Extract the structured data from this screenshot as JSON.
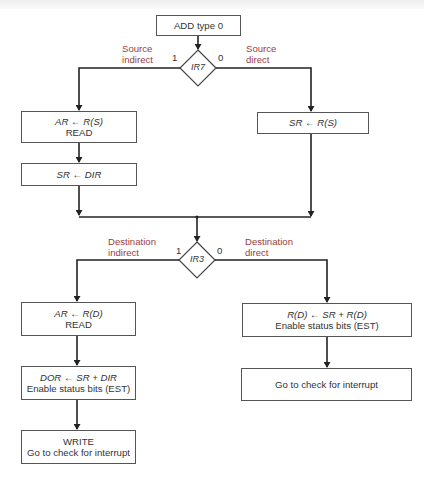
{
  "diagram": {
    "type": "flowchart",
    "start": {
      "label": "ADD type 0"
    },
    "decision1": {
      "condition": "IR7",
      "true_bit": "1",
      "false_bit": "0",
      "true_label_line1": "Source",
      "true_label_line2": "indirect",
      "false_label_line1": "Source",
      "false_label_line2": "direct"
    },
    "source_indirect": [
      {
        "line1_a": "AR",
        "arrow": "←",
        "line1_b": "R(S)",
        "line2": "READ"
      },
      {
        "line1_a": "SR",
        "arrow": "←",
        "line1_b": "DIR"
      }
    ],
    "source_direct": [
      {
        "line1_a": "SR",
        "arrow": "←",
        "line1_b": "R(S)"
      }
    ],
    "decision2": {
      "condition": "IR3",
      "true_bit": "1",
      "false_bit": "0",
      "true_label_line1": "Destination",
      "true_label_line2": "indirect",
      "false_label_line1": "Destination",
      "false_label_line2": "direct"
    },
    "dest_indirect": [
      {
        "line1_a": "AR",
        "arrow": "←",
        "line1_b": "R(D)",
        "line2": "READ"
      },
      {
        "line1_a": "DOR",
        "arrow": "←",
        "line1_b": "SR + DIR",
        "line2": "Enable status bits (EST)"
      },
      {
        "line1": "WRITE",
        "line2": "Go to check for interrupt"
      }
    ],
    "dest_direct": [
      {
        "line1_a": "R(D)",
        "arrow": "←",
        "line1_b": "SR + R(D)",
        "line2": "Enable status bits (EST)"
      },
      {
        "line1": "Go to check for interrupt"
      }
    ],
    "colors": {
      "branch_label": "#9a3d3d",
      "lines": "#222222",
      "box_border": "#555555"
    }
  }
}
